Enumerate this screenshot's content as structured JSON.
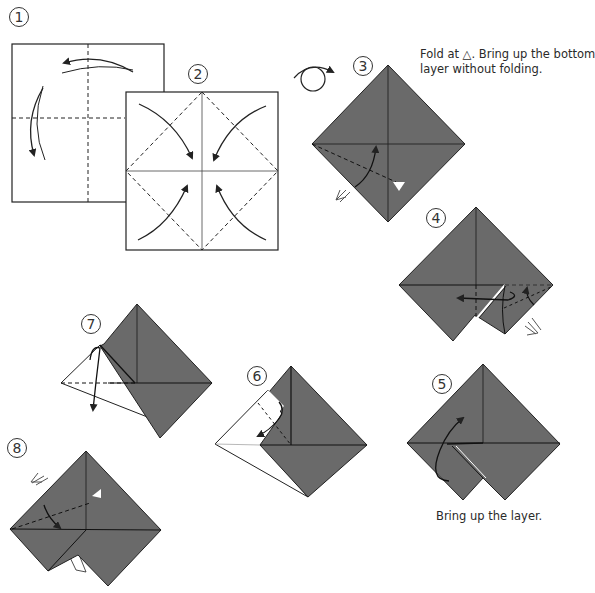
{
  "diagram": {
    "colors": {
      "paper_colored": "#6a6a6a",
      "paper_white": "#ffffff",
      "line": "#222222",
      "background": "#ffffff"
    },
    "steps": [
      {
        "number": "1",
        "label_pos": [
          10,
          8
        ]
      },
      {
        "number": "2",
        "label_pos": [
          188,
          64
        ]
      },
      {
        "number": "3",
        "label_pos": [
          353,
          56
        ],
        "caption": [
          "Fold at △. Bring up the bottom",
          "layer without folding."
        ]
      },
      {
        "number": "4",
        "label_pos": [
          426,
          208
        ]
      },
      {
        "number": "5",
        "label_pos": [
          432,
          374
        ],
        "caption": [
          "Bring up the layer."
        ]
      },
      {
        "number": "6",
        "label_pos": [
          248,
          366
        ]
      },
      {
        "number": "7",
        "label_pos": [
          82,
          314
        ]
      },
      {
        "number": "8",
        "label_pos": [
          7,
          438
        ]
      }
    ],
    "captions": {
      "step3_line1": "Fold at △. Bring up the bottom",
      "step3_line2": "layer without folding.",
      "step5": "Bring up the layer."
    },
    "icons": [
      "turn-over-icon",
      "valley-fold-arrow-icon",
      "push-arrow-icon",
      "triangle-marker-icon"
    ]
  }
}
